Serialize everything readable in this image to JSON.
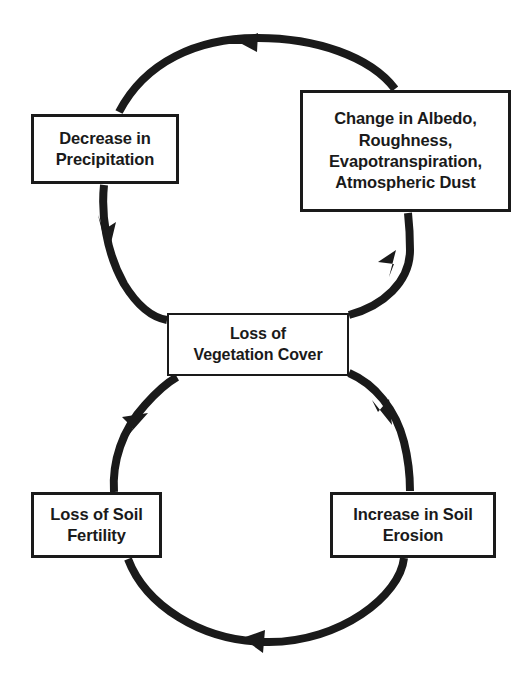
{
  "diagram": {
    "type": "cycle-diagram",
    "colors": {
      "background": "#ffffff",
      "stroke": "#1a1a1a",
      "text": "#1a1a1a"
    },
    "nodes": [
      {
        "id": "decrease-precipitation",
        "label": "Decrease in\nPrecipitation",
        "position": "top-left"
      },
      {
        "id": "change-albedo",
        "label": "Change in Albedo,\nRoughness,\nEvapotranspiration,\nAtmospheric Dust",
        "position": "top-right"
      },
      {
        "id": "loss-vegetation-cover",
        "label": "Loss of\nVegetation Cover",
        "position": "center"
      },
      {
        "id": "loss-soil-fertility",
        "label": "Loss of Soil\nFertility",
        "position": "bottom-left"
      },
      {
        "id": "increase-soil-erosion",
        "label": "Increase in Soil\nErosion",
        "position": "bottom-right"
      }
    ],
    "connections": [
      {
        "id": "vegetation-to-albedo",
        "from": "loss-vegetation-cover",
        "to": "change-albedo",
        "direction": "up-right",
        "arrowhead": "up"
      },
      {
        "id": "albedo-to-precipitation",
        "from": "change-albedo",
        "to": "decrease-precipitation",
        "direction": "over-top-leftward",
        "arrowhead": "left"
      },
      {
        "id": "precipitation-to-vegetation",
        "from": "decrease-precipitation",
        "to": "loss-vegetation-cover",
        "direction": "down-right",
        "arrowhead": "down"
      },
      {
        "id": "vegetation-to-erosion",
        "from": "loss-vegetation-cover",
        "to": "increase-soil-erosion",
        "direction": "down-right",
        "arrowhead": "down"
      },
      {
        "id": "erosion-to-fertility",
        "from": "increase-soil-erosion",
        "to": "loss-soil-fertility",
        "direction": "under-bottom-leftward",
        "arrowhead": "left"
      },
      {
        "id": "fertility-to-vegetation",
        "from": "loss-soil-fertility",
        "to": "loss-vegetation-cover",
        "direction": "up-right",
        "arrowhead": "up"
      }
    ]
  }
}
